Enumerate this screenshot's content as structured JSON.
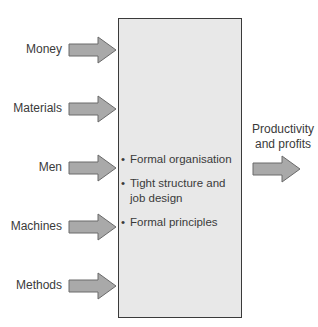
{
  "diagram": {
    "inputs": [
      {
        "label": "Money"
      },
      {
        "label": "Materials"
      },
      {
        "label": "Men"
      },
      {
        "label": "Machines"
      },
      {
        "label": "Methods"
      }
    ],
    "process_box": {
      "bullets": [
        {
          "marker": "•",
          "text": "Formal organisation"
        },
        {
          "marker": "•",
          "text": "Tight structure and job design"
        },
        {
          "marker": "•",
          "text": "Formal principles"
        }
      ]
    },
    "output": {
      "label": "Productivity and profits"
    },
    "colors": {
      "arrow_fill": "#a9a9a9",
      "arrow_stroke": "#6a6a6a",
      "box_fill": "#e8e8e8",
      "box_border": "#3a3a3a"
    }
  }
}
